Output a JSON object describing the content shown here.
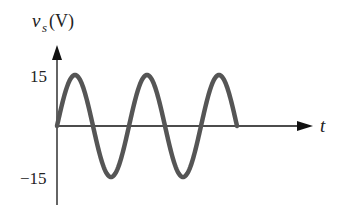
{
  "chart_data": {
    "type": "line",
    "title": "",
    "xlabel": "t",
    "ylabel": "v_s(V)",
    "ylabel_main": "v",
    "ylabel_sub": "s",
    "ylabel_unit": "(V)",
    "yticks": [
      "15",
      "−15"
    ],
    "ylim": [
      -15,
      15
    ],
    "series": [
      {
        "name": "v_s",
        "shape": "sine",
        "amplitude": 15,
        "cycles": 2.5,
        "start_phase": 0,
        "color": "#555555"
      }
    ],
    "x": [
      0,
      0.25,
      0.5,
      0.75,
      1.0,
      1.25,
      1.5,
      1.75,
      2.0,
      2.25,
      2.5
    ],
    "values": [
      0,
      15,
      0,
      -15,
      0,
      15,
      0,
      -15,
      0,
      15,
      0
    ],
    "grid": false,
    "legend": "none"
  },
  "colors": {
    "curve": "#555555",
    "axis": "#111111"
  }
}
